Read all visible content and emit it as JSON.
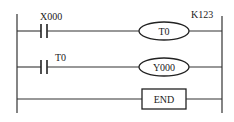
{
  "diagram": {
    "type": "ladder-logic",
    "colors": {
      "line": "#333333",
      "background": "#ffffff",
      "text": "#222222"
    },
    "rungs": [
      {
        "contact": {
          "type": "normally-open",
          "label": "X000"
        },
        "output": {
          "type": "coil",
          "label": "T0",
          "parameter": "K123"
        }
      },
      {
        "contact": {
          "type": "normally-open",
          "label": "T0"
        },
        "output": {
          "type": "coil",
          "label": "Y000"
        }
      },
      {
        "output": {
          "type": "instruction",
          "label": "END"
        }
      }
    ]
  }
}
